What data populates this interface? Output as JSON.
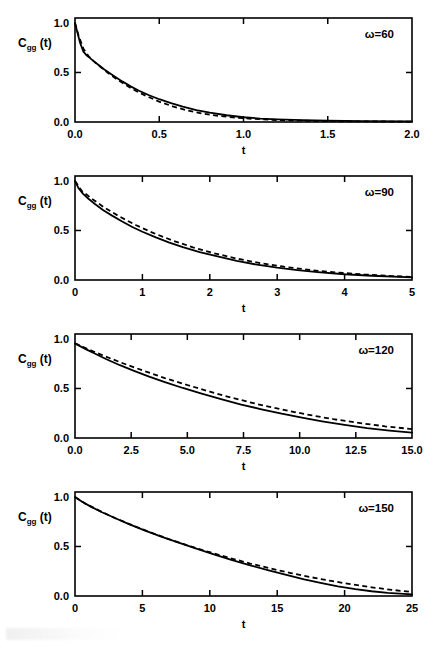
{
  "figure": {
    "ylabel_main": "C",
    "ylabel_sub": "gg",
    "ylabel_tail": "(t)",
    "xlabel": "t",
    "y_ticks": [
      "0.0",
      "0.5",
      "1.0"
    ],
    "y_tick_values": [
      0.0,
      0.5,
      1.0
    ],
    "ylim": [
      0.0,
      1.05
    ]
  },
  "chart_data": [
    {
      "type": "line",
      "title": "",
      "annotation": "ω=60",
      "omega": 60,
      "xlabel": "t",
      "ylabel": "C_gg(t)",
      "xlim": [
        0.0,
        2.0
      ],
      "ylim": [
        0.0,
        1.05
      ],
      "xticks": [
        0.0,
        0.5,
        1.0,
        1.5,
        2.0
      ],
      "xtick_labels": [
        "0.0",
        "0.5",
        "1.0",
        "1.5",
        "2.0"
      ],
      "yticks": [
        0.0,
        0.5,
        1.0
      ],
      "ytick_labels": [
        "0.0",
        "0.5",
        "1.0"
      ],
      "grid": false,
      "legend": "none",
      "series": [
        {
          "name": "solid",
          "style": "solid",
          "x": [
            0.0,
            0.015,
            0.03,
            0.05,
            0.07,
            0.09,
            0.11,
            0.14,
            0.17,
            0.2,
            0.24,
            0.28,
            0.33,
            0.38,
            0.44,
            0.5,
            0.57,
            0.64,
            0.72,
            0.8,
            0.9,
            1.0,
            1.1,
            1.2,
            1.35,
            1.5,
            1.7,
            2.0
          ],
          "y": [
            1.0,
            0.9,
            0.8,
            0.71,
            0.67,
            0.645,
            0.615,
            0.575,
            0.535,
            0.5,
            0.455,
            0.41,
            0.36,
            0.315,
            0.27,
            0.23,
            0.19,
            0.155,
            0.12,
            0.095,
            0.068,
            0.048,
            0.035,
            0.026,
            0.018,
            0.013,
            0.009,
            0.006
          ]
        },
        {
          "name": "dashed",
          "style": "dashed",
          "x": [
            0.0,
            0.02,
            0.05,
            0.08,
            0.12,
            0.16,
            0.2,
            0.25,
            0.3,
            0.36,
            0.42,
            0.5,
            0.58,
            0.66,
            0.75,
            0.85,
            0.95,
            1.05,
            1.2,
            1.4,
            1.6,
            1.8,
            2.0
          ],
          "y": [
            1.0,
            0.88,
            0.74,
            0.665,
            0.6,
            0.545,
            0.49,
            0.43,
            0.375,
            0.315,
            0.265,
            0.205,
            0.158,
            0.12,
            0.087,
            0.062,
            0.044,
            0.032,
            0.02,
            0.011,
            0.007,
            0.005,
            0.004
          ]
        }
      ]
    },
    {
      "type": "line",
      "title": "",
      "annotation": "ω=90",
      "omega": 90,
      "xlabel": "t",
      "ylabel": "C_gg(t)",
      "xlim": [
        0.0,
        5.0
      ],
      "ylim": [
        0.0,
        1.05
      ],
      "xticks": [
        0,
        1,
        2,
        3,
        4,
        5
      ],
      "xtick_labels": [
        "0",
        "1",
        "2",
        "3",
        "4",
        "5"
      ],
      "yticks": [
        0.0,
        0.5,
        1.0
      ],
      "ytick_labels": [
        "0.0",
        "0.5",
        "1.0"
      ],
      "grid": false,
      "legend": "none",
      "series": [
        {
          "name": "solid",
          "style": "solid",
          "x": [
            0.0,
            0.05,
            0.12,
            0.2,
            0.3,
            0.42,
            0.55,
            0.7,
            0.85,
            1.0,
            1.2,
            1.4,
            1.6,
            1.85,
            2.1,
            2.4,
            2.7,
            3.0,
            3.3,
            3.6,
            4.0,
            4.4,
            5.0
          ],
          "y": [
            1.0,
            0.93,
            0.87,
            0.82,
            0.765,
            0.705,
            0.65,
            0.59,
            0.535,
            0.487,
            0.43,
            0.378,
            0.332,
            0.282,
            0.24,
            0.192,
            0.155,
            0.124,
            0.1,
            0.08,
            0.058,
            0.043,
            0.026
          ]
        },
        {
          "name": "dashed",
          "style": "dashed",
          "x": [
            0.0,
            0.1,
            0.25,
            0.45,
            0.65,
            0.9,
            1.15,
            1.45,
            1.75,
            2.05,
            2.4,
            2.75,
            3.1,
            3.5,
            3.9,
            4.3,
            4.7,
            5.0
          ],
          "y": [
            1.0,
            0.9,
            0.82,
            0.725,
            0.645,
            0.555,
            0.478,
            0.398,
            0.33,
            0.272,
            0.216,
            0.17,
            0.134,
            0.1,
            0.075,
            0.055,
            0.04,
            0.032
          ]
        }
      ]
    },
    {
      "type": "line",
      "title": "",
      "annotation": "ω=120",
      "omega": 120,
      "xlabel": "t",
      "ylabel": "C_gg(t)",
      "xlim": [
        0.0,
        15.0
      ],
      "ylim": [
        0.0,
        1.05
      ],
      "xticks": [
        0.0,
        2.5,
        5.0,
        7.5,
        10.0,
        12.5,
        15.0
      ],
      "xtick_labels": [
        "0.0",
        "2.5",
        "5.0",
        "7.5",
        "10.0",
        "12.5",
        "15.0"
      ],
      "yticks": [
        0.0,
        0.5,
        1.0
      ],
      "ytick_labels": [
        "0.0",
        "0.5",
        "1.0"
      ],
      "grid": false,
      "legend": "none",
      "series": [
        {
          "name": "solid",
          "style": "solid",
          "x": [
            0.0,
            0.2,
            0.5,
            0.9,
            1.4,
            2.0,
            2.6,
            3.3,
            4.0,
            4.8,
            5.6,
            6.5,
            7.4,
            8.3,
            9.2,
            10.1,
            11.0,
            12.0,
            13.0,
            14.0,
            15.0
          ],
          "y": [
            0.955,
            0.93,
            0.895,
            0.85,
            0.795,
            0.735,
            0.68,
            0.62,
            0.565,
            0.505,
            0.45,
            0.392,
            0.338,
            0.29,
            0.245,
            0.205,
            0.168,
            0.132,
            0.1,
            0.075,
            0.055
          ]
        },
        {
          "name": "dashed",
          "style": "dashed",
          "x": [
            0.0,
            0.3,
            0.8,
            1.5,
            2.3,
            3.1,
            4.0,
            5.0,
            6.0,
            7.0,
            8.1,
            9.2,
            10.3,
            11.5,
            12.7,
            13.8,
            15.0
          ],
          "y": [
            0.955,
            0.925,
            0.875,
            0.81,
            0.74,
            0.675,
            0.605,
            0.535,
            0.468,
            0.405,
            0.343,
            0.288,
            0.238,
            0.19,
            0.15,
            0.118,
            0.09
          ]
        }
      ]
    },
    {
      "type": "line",
      "title": "",
      "annotation": "ω=150",
      "omega": 150,
      "xlabel": "t",
      "ylabel": "C_gg(t)",
      "xlim": [
        0.0,
        25.0
      ],
      "ylim": [
        0.0,
        1.05
      ],
      "xticks": [
        0,
        5,
        10,
        15,
        20,
        25
      ],
      "xtick_labels": [
        "0",
        "5",
        "10",
        "15",
        "20",
        "25"
      ],
      "yticks": [
        0.0,
        0.5,
        1.0
      ],
      "ytick_labels": [
        "0.0",
        "0.5",
        "1.0"
      ],
      "grid": false,
      "legend": "none",
      "series": [
        {
          "name": "solid",
          "style": "solid",
          "x": [
            0.0,
            0.5,
            1.2,
            2.0,
            3.0,
            4.0,
            5.2,
            6.5,
            7.8,
            9.0,
            10.3,
            11.6,
            13.0,
            14.3,
            15.6,
            17.0,
            18.3,
            19.5,
            20.8,
            22.0,
            23.2,
            25.0
          ],
          "y": [
            1.0,
            0.955,
            0.9,
            0.845,
            0.785,
            0.725,
            0.66,
            0.595,
            0.533,
            0.478,
            0.42,
            0.365,
            0.31,
            0.262,
            0.215,
            0.168,
            0.13,
            0.098,
            0.07,
            0.048,
            0.032,
            0.016
          ]
        },
        {
          "name": "dashed",
          "style": "dashed",
          "x": [
            0.0,
            0.8,
            1.8,
            3.0,
            4.3,
            5.7,
            7.1,
            8.6,
            10.0,
            11.5,
            13.0,
            14.5,
            16.0,
            17.5,
            19.0,
            20.5,
            22.0,
            23.5,
            25.0
          ],
          "y": [
            1.0,
            0.93,
            0.862,
            0.785,
            0.712,
            0.637,
            0.568,
            0.5,
            0.442,
            0.383,
            0.328,
            0.278,
            0.232,
            0.19,
            0.152,
            0.118,
            0.088,
            0.062,
            0.04
          ]
        }
      ]
    }
  ]
}
